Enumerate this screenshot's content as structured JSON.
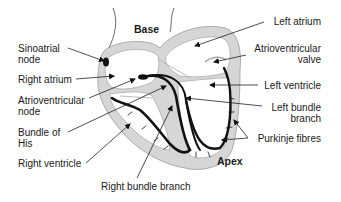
{
  "diagram": {
    "colors": {
      "wall": "#d4d4d4",
      "wall_edge": "#9a9a9a",
      "conduction": "#111111",
      "text": "#1a1a1a",
      "background": "#ffffff"
    },
    "regions": {
      "top": "Base",
      "bottom": "Apex"
    },
    "labels_left": [
      {
        "id": "sinoatrial-node",
        "text": "Sinoatrial\nnode",
        "line1": "Sinoatrial",
        "line2": "node"
      },
      {
        "id": "right-atrium",
        "text": "Right atrium"
      },
      {
        "id": "atrioventricular-node",
        "line1": "Atrioventricular",
        "line2": "node"
      },
      {
        "id": "bundle-of-his",
        "line1": "Bundle of",
        "line2": "His"
      },
      {
        "id": "right-ventricle",
        "text": "Right ventricle"
      }
    ],
    "labels_right": [
      {
        "id": "left-atrium",
        "text": "Left atrium"
      },
      {
        "id": "atrioventricular-valve",
        "line1": "Atrioventricular",
        "line2": "valve"
      },
      {
        "id": "left-ventricle",
        "text": "Left ventricle"
      },
      {
        "id": "left-bundle-branch",
        "line1": "Left bundle",
        "line2": "branch"
      },
      {
        "id": "purkinje-fibres",
        "text": "Purkinje fibres"
      }
    ],
    "labels_bottom": [
      {
        "id": "right-bundle-branch",
        "text": "Right bundle branch"
      }
    ]
  }
}
